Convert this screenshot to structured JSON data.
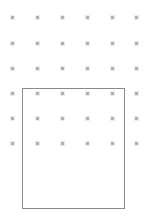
{
  "canvas": {
    "width": 147,
    "height": 221,
    "background_color": "#ffffff",
    "label": "Drawing canvas"
  },
  "grid": {
    "label": "Snap point grid",
    "dot_color": "#b2b2b6",
    "dot_size": 3,
    "columns": 6,
    "rows": 6,
    "x_positions": [
      12,
      37,
      62,
      87,
      112,
      136
    ],
    "y_positions": [
      17,
      43,
      68,
      93,
      118,
      143
    ]
  },
  "shapes": [
    {
      "name": "rectangle",
      "label": "Rectangle",
      "x": 22,
      "y": 88,
      "width": 103,
      "height": 121,
      "stroke_color": "#8a8a8e",
      "stroke_width": 1,
      "fill": "none"
    }
  ]
}
